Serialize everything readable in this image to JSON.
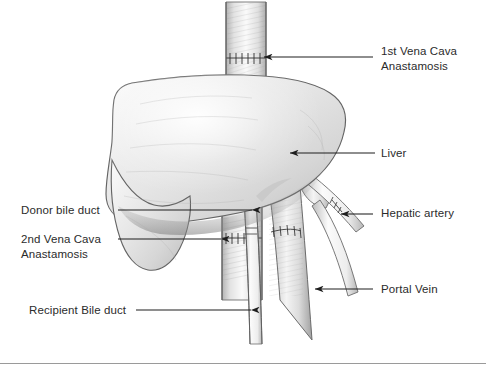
{
  "figure": {
    "background_color": "#ffffff",
    "ink_color": "#2b2b2b",
    "rule_color": "#9a9a9a"
  },
  "labels": {
    "vena_cava_1": "1st Vena Cava\nAnastamosis",
    "liver": "Liver",
    "hepatic_artery": "Hepatic artery",
    "portal_vein": "Portal Vein",
    "donor_bile_duct": "Donor bile duct",
    "vena_cava_2": "2nd Vena Cava\nAnastamosis",
    "recipient_bile_duct": "Recipient Bile duct"
  },
  "structures": [
    {
      "name": "liver",
      "label": "Liver"
    },
    {
      "name": "inferior-vena-cava-superior",
      "label": "1st Vena Cava Anastamosis"
    },
    {
      "name": "inferior-vena-cava-inferior",
      "label": "2nd Vena Cava Anastamosis"
    },
    {
      "name": "donor-bile-duct",
      "label": "Donor bile duct"
    },
    {
      "name": "recipient-bile-duct",
      "label": "Recipient Bile duct"
    },
    {
      "name": "hepatic-artery",
      "label": "Hepatic artery"
    },
    {
      "name": "portal-vein",
      "label": "Portal Vein"
    }
  ]
}
